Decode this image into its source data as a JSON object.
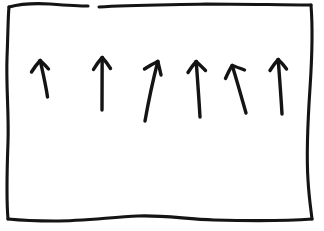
{
  "image": {
    "title": "Hand-drawn sketch of six upward arrows inside a rectangular frame",
    "kind": "whiteboard-sketch",
    "width": 324,
    "height": 231,
    "background_color": "#ffffff",
    "ink_color": "#141414"
  },
  "frame": {
    "label": "hand-drawn rectangle border",
    "style": "wobbly hand-drawn single stroke",
    "stroke_width": 3.1,
    "has_top_gap": true,
    "top_gap_start_x": 88,
    "top_gap_end_x": 98,
    "segments": {
      "top_left": "M 9,7 C 20,4 34,3 50,4 C 64,5 78,6 88,6",
      "top_right": "M 99,7 C 130,5 168,5 206,4 C 244,4 284,5 311,5",
      "right": "M 311,5 C 313,30 312,58 310,88 C 308,118 306,150 308,180 C 309,198 311,210 312,219",
      "bottom": "M 312,219 C 286,221 252,221 214,220 C 186,219 162,215 138,216 C 112,217 84,221 54,221 C 34,221 18,220 8,219",
      "left": "M 8,219 C 6,196 7,170 8,142 C 9,114 6,86 7,58 C 8,34 8,16 9,7"
    }
  },
  "arrows": {
    "label": "six hand-drawn arrows pointing upward",
    "count": 6,
    "stroke_width": 3.4,
    "items": [
      {
        "id": "arrow-1",
        "order": 1,
        "tip": {
          "x": 40,
          "y": 60
        },
        "tail": {
          "x": 48,
          "y": 97
        },
        "tilt_degrees": -12,
        "length": 38,
        "shaft": "M 47.5,97 C 46,86 43,73 40.2,60.5",
        "head_left": "M 40.2,60.5 C 37,64 34,68 31.5,72",
        "head_right": "M 40.2,60.5 C 43.5,63.5 46,66 48.5,69"
      },
      {
        "id": "arrow-2",
        "order": 2,
        "tip": {
          "x": 102,
          "y": 57
        },
        "tail": {
          "x": 102,
          "y": 110
        },
        "tilt_degrees": 0,
        "length": 53,
        "shaft": "M 102,110 C 102,95 102,76 102.2,57.5",
        "head_left": "M 102.2,57.5 C 99,61 96,65 93.5,69.5",
        "head_right": "M 102.2,57.5 C 105.5,61 108,64.5 110.5,68.5"
      },
      {
        "id": "arrow-3",
        "order": 3,
        "tip": {
          "x": 158,
          "y": 61
        },
        "tail": {
          "x": 145,
          "y": 121
        },
        "tilt_degrees": 12,
        "length": 61,
        "shaft": "M 145,121 C 148,104 152.5,82 157.8,61.5",
        "head_left": "M 157.8,61.5 C 153.5,63.5 149,66 144.5,69",
        "head_right": "M 157.8,61.5 C 159,66 160,70.5 161,75"
      },
      {
        "id": "arrow-4",
        "order": 4,
        "tip": {
          "x": 196,
          "y": 61
        },
        "tail": {
          "x": 200,
          "y": 117
        },
        "tilt_degrees": -4,
        "length": 56,
        "shaft": "M 200,117 C 199,99 197.5,79 196.2,61.5",
        "head_left": "M 196.2,61.5 C 193,65 190.5,68.5 188,72.5",
        "head_right": "M 196.2,61.5 C 199.5,64.5 202.5,67.5 205.5,70.5"
      },
      {
        "id": "arrow-5",
        "order": 5,
        "tip": {
          "x": 232,
          "y": 65
        },
        "tail": {
          "x": 246,
          "y": 113
        },
        "tilt_degrees": -16,
        "length": 50,
        "shaft": "M 246,113 C 242,99 237,81 232.2,65.5",
        "head_left": "M 232.2,65.5 C 229.5,69.5 227.5,74 225.5,78.5",
        "head_right": "M 232.2,65.5 C 236.5,67 240.5,68.5 244.5,70"
      },
      {
        "id": "arrow-6",
        "order": 6,
        "tip": {
          "x": 278,
          "y": 59
        },
        "tail": {
          "x": 282,
          "y": 114
        },
        "tilt_degrees": -4,
        "length": 55,
        "shaft": "M 282,114 C 281,96 279.5,77 278.2,59.5",
        "head_left": "M 278.2,59.5 C 275,63 272.5,66.5 270,70.5",
        "head_right": "M 278.2,59.5 C 281.5,62.5 284,65.5 286.5,69"
      }
    ]
  }
}
